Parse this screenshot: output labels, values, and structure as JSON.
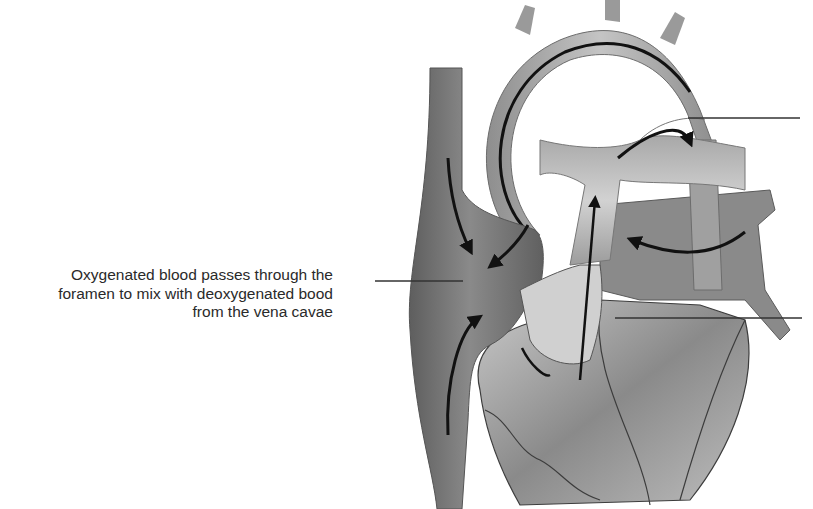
{
  "diagram": {
    "labels": [
      {
        "id": "foramen-label",
        "lines": [
          "Oxygenated blood passes through the",
          "foramen to mix with deoxygenated bood",
          "from the vena cavae"
        ]
      }
    ],
    "unlabeled_leader_lines": 2,
    "colors": {
      "background": "#ffffff",
      "text": "#2a2a2a",
      "leader_line": "#333333",
      "vessel_dark": "#6e6e6e",
      "vessel_mid": "#9a9a9a",
      "vessel_light": "#c8c8c8",
      "arrow": "#111111"
    }
  }
}
